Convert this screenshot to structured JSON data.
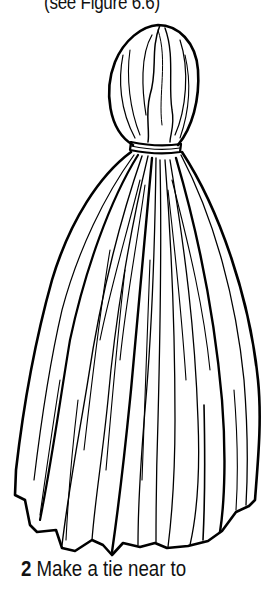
{
  "page": {
    "top_caption": "(see Figure 6.6)",
    "figure": {
      "subject": "tassel-illustration",
      "description": "Line drawing of a tassel: a rounded gathered head, a tie band wrapped around the neck, and a long skirt of strands with a jagged trimmed bottom edge",
      "line_color": "#000000",
      "background_color": "#ffffff"
    },
    "instruction": {
      "step_number": "2",
      "text": "Make a tie near to"
    }
  }
}
